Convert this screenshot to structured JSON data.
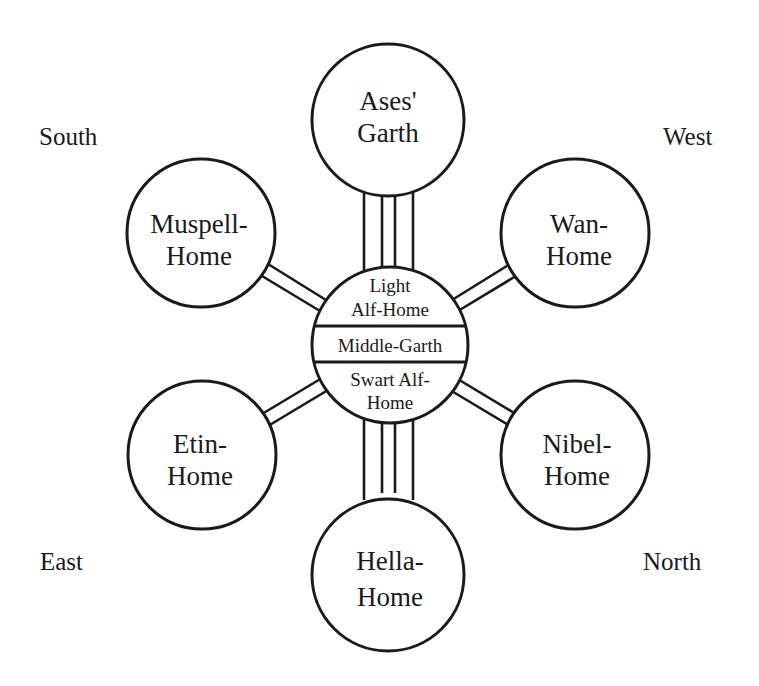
{
  "diagram": {
    "type": "hub-and-spoke cosmology diagram",
    "center": {
      "top_label_line1": "Light",
      "top_label_line2": "Alf-Home",
      "middle_label": "Middle-Garth",
      "bottom_label_line1": "Swart Alf-",
      "bottom_label_line2": "Home"
    },
    "worlds": [
      {
        "id": "ases-garth",
        "line1": "Ases'",
        "line2": "Garth",
        "position": "top",
        "connector": "triple-line"
      },
      {
        "id": "wan-home",
        "line1": "Wan-",
        "line2": "Home",
        "position": "upper-right",
        "connector": "double-line"
      },
      {
        "id": "nibel-home",
        "line1": "Nibel-",
        "line2": "Home",
        "position": "lower-right",
        "connector": "double-line"
      },
      {
        "id": "hella-home",
        "line1": "Hella-",
        "line2": "Home",
        "position": "bottom",
        "connector": "triple-line"
      },
      {
        "id": "etin-home",
        "line1": "Etin-",
        "line2": "Home",
        "position": "lower-left",
        "connector": "double-line"
      },
      {
        "id": "muspell-home",
        "line1": "Muspell-",
        "line2": "Home",
        "position": "upper-left",
        "connector": "double-line"
      }
    ],
    "directions": {
      "top_left": "South",
      "top_right": "West",
      "bottom_left": "East",
      "bottom_right": "North"
    }
  }
}
